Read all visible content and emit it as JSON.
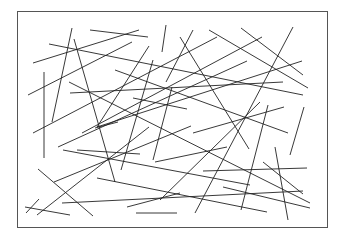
{
  "diagram": {
    "type": "random-line-segments",
    "frame": {
      "x": 17,
      "y": 11,
      "width": 310,
      "height": 216,
      "stroke": "#555555"
    },
    "line_color": "#222222",
    "segments": [
      [
        72,
        28,
        52,
        122
      ],
      [
        74,
        39,
        115,
        182
      ],
      [
        33,
        63,
        139,
        30
      ],
      [
        90,
        30,
        148,
        37
      ],
      [
        49,
        44,
        303,
        95
      ],
      [
        28,
        95,
        132,
        42
      ],
      [
        44,
        72,
        44,
        158
      ],
      [
        166,
        25,
        162,
        52
      ],
      [
        180,
        37,
        249,
        149
      ],
      [
        193,
        30,
        166,
        82
      ],
      [
        209,
        30,
        308,
        88
      ],
      [
        241,
        28,
        303,
        75
      ],
      [
        293,
        27,
        195,
        213
      ],
      [
        33,
        133,
        217,
        37
      ],
      [
        115,
        70,
        288,
        133
      ],
      [
        70,
        93,
        283,
        82
      ],
      [
        69,
        82,
        310,
        203
      ],
      [
        149,
        46,
        97,
        127
      ],
      [
        153,
        60,
        121,
        170
      ],
      [
        82,
        133,
        262,
        37
      ],
      [
        58,
        147,
        247,
        61
      ],
      [
        133,
        98,
        187,
        109
      ],
      [
        172,
        87,
        153,
        160
      ],
      [
        302,
        61,
        97,
        127
      ],
      [
        260,
        102,
        160,
        200
      ],
      [
        268,
        105,
        241,
        210
      ],
      [
        193,
        133,
        284,
        107
      ],
      [
        304,
        107,
        290,
        155
      ],
      [
        155,
        162,
        227,
        147
      ],
      [
        63,
        150,
        250,
        185
      ],
      [
        77,
        150,
        140,
        154
      ],
      [
        38,
        169,
        93,
        216
      ],
      [
        54,
        182,
        191,
        126
      ],
      [
        37,
        215,
        149,
        127
      ],
      [
        97,
        178,
        267,
        212
      ],
      [
        203,
        171,
        307,
        168
      ],
      [
        263,
        162,
        303,
        194
      ],
      [
        275,
        147,
        288,
        220
      ],
      [
        223,
        187,
        310,
        208
      ],
      [
        62,
        203,
        303,
        191
      ],
      [
        127,
        207,
        180,
        193
      ],
      [
        136,
        213,
        177,
        213
      ],
      [
        26,
        213,
        39,
        199
      ],
      [
        25,
        207,
        70,
        215
      ],
      [
        118,
        122,
        95,
        128
      ]
    ]
  }
}
